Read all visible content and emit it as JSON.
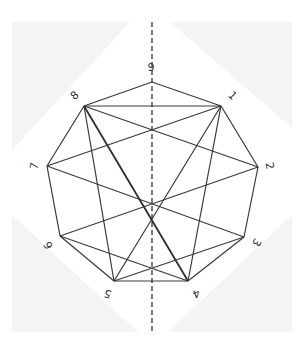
{
  "diagram": {
    "type": "nonagon-symmetry-figure",
    "vertices": [
      {
        "id": "1",
        "label": "1",
        "x": 221,
        "y": 106,
        "lx": 232,
        "ly": 96,
        "rot": 45
      },
      {
        "id": "2",
        "label": "2",
        "x": 258,
        "y": 167,
        "lx": 269,
        "ly": 166,
        "rot": 80
      },
      {
        "id": "3",
        "label": "3",
        "x": 244,
        "y": 237,
        "lx": 256,
        "ly": 242,
        "rot": 120
      },
      {
        "id": "4",
        "label": "4",
        "x": 188,
        "y": 281,
        "lx": 196,
        "ly": 293,
        "rot": 160
      },
      {
        "id": "5",
        "label": "5",
        "x": 114,
        "y": 281,
        "lx": 108,
        "ly": 293,
        "rot": 200
      },
      {
        "id": "6",
        "label": "6",
        "x": 60,
        "y": 236,
        "lx": 49,
        "ly": 245,
        "rot": 240
      },
      {
        "id": "7",
        "label": "7",
        "x": 47,
        "y": 166,
        "lx": 35,
        "ly": 166,
        "rot": 280
      },
      {
        "id": "8",
        "label": "8",
        "x": 84,
        "y": 106,
        "lx": 75,
        "ly": 96,
        "rot": 320
      },
      {
        "id": "9",
        "label": "9",
        "x": 152,
        "y": 82,
        "lx": 151,
        "ly": 68,
        "rot": 0
      }
    ],
    "edges": [
      [
        "9",
        "1"
      ],
      [
        "1",
        "2"
      ],
      [
        "2",
        "3"
      ],
      [
        "3",
        "4"
      ],
      [
        "4",
        "5"
      ],
      [
        "5",
        "6"
      ],
      [
        "6",
        "7"
      ],
      [
        "7",
        "8"
      ],
      [
        "8",
        "9"
      ],
      [
        "8",
        "1"
      ],
      [
        "8",
        "2"
      ],
      [
        "1",
        "7"
      ],
      [
        "8",
        "5"
      ],
      [
        "1",
        "5"
      ],
      [
        "1",
        "4"
      ],
      [
        "7",
        "3"
      ],
      [
        "6",
        "2"
      ],
      [
        "6",
        "4"
      ],
      [
        "5",
        "3"
      ]
    ],
    "thick_edges": [
      [
        "8",
        "4"
      ]
    ],
    "axis": {
      "x": 152,
      "y1": 22,
      "y2": 332,
      "style": "dashed"
    },
    "corners": [
      "12,22 130,22 12,150",
      "170,22 292,22 292,128",
      "12,215 12,332 138,332",
      "292,215 292,332 168,332"
    ],
    "colors": {
      "line": "#3a3a3a",
      "corner_fill": "#f4f4f4",
      "background": "#ffffff"
    }
  }
}
